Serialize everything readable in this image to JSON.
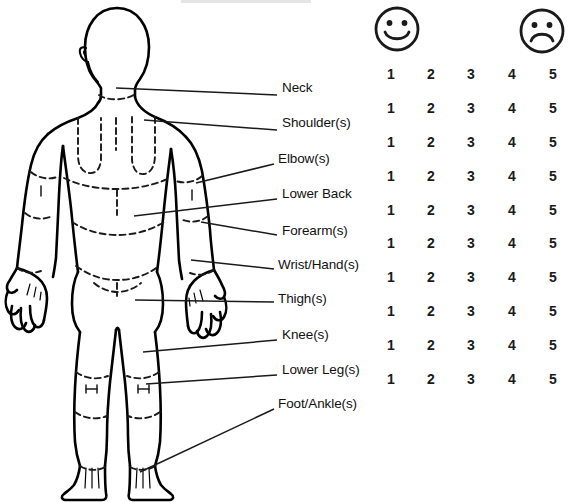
{
  "diagram": {
    "name": "body-map-rear-view"
  },
  "labels": [
    {
      "id": "neck",
      "text": "Neck",
      "x": 282,
      "y": 88,
      "lead": {
        "x1": 116,
        "y1": 88,
        "x2": 277,
        "y2": 95
      }
    },
    {
      "id": "shoulder",
      "text": "Shoulder(s)",
      "x": 282,
      "y": 123,
      "lead": {
        "x1": 144,
        "y1": 120,
        "x2": 277,
        "y2": 130
      }
    },
    {
      "id": "elbow",
      "text": "Elbow(s)",
      "x": 278,
      "y": 159,
      "lead": {
        "x1": 196,
        "y1": 183,
        "x2": 274,
        "y2": 164
      }
    },
    {
      "id": "lower-back",
      "text": "Lower Back",
      "x": 282,
      "y": 194,
      "lead": {
        "x1": 134,
        "y1": 216,
        "x2": 277,
        "y2": 199
      }
    },
    {
      "id": "forearm",
      "text": "Forearm(s)",
      "x": 282,
      "y": 231,
      "lead": {
        "x1": 201,
        "y1": 222,
        "x2": 277,
        "y2": 235
      }
    },
    {
      "id": "wrist-hand",
      "text": "Wrist/Hand(s)",
      "x": 278,
      "y": 265,
      "lead": {
        "x1": 191,
        "y1": 260,
        "x2": 274,
        "y2": 269
      }
    },
    {
      "id": "thigh",
      "text": "Thigh(s)",
      "x": 278,
      "y": 299,
      "lead": {
        "x1": 135,
        "y1": 300,
        "x2": 274,
        "y2": 302
      }
    },
    {
      "id": "knee",
      "text": "Knee(s)",
      "x": 282,
      "y": 335,
      "lead": {
        "x1": 143,
        "y1": 352,
        "x2": 277,
        "y2": 340
      }
    },
    {
      "id": "lower-leg",
      "text": "Lower Leg(s)",
      "x": 282,
      "y": 370,
      "lead": {
        "x1": 146,
        "y1": 384,
        "x2": 277,
        "y2": 375
      }
    },
    {
      "id": "foot-ankle",
      "text": "Foot/Ankle(s)",
      "x": 278,
      "y": 404,
      "lead": {
        "x1": 140,
        "y1": 472,
        "x2": 274,
        "y2": 409
      }
    }
  ],
  "scale": {
    "happy_icon": "smiley-happy-face",
    "sad_icon": "smiley-sad-face",
    "min_label": "1",
    "max_label": "5",
    "columns": [
      "1",
      "2",
      "3",
      "4",
      "5"
    ],
    "rows": [
      {
        "part": "Neck",
        "values": [
          "1",
          "2",
          "3",
          "4",
          "5"
        ]
      },
      {
        "part": "Shoulder(s)",
        "values": [
          "1",
          "2",
          "3",
          "4",
          "5"
        ]
      },
      {
        "part": "Elbow(s)",
        "values": [
          "1",
          "2",
          "3",
          "4",
          "5"
        ]
      },
      {
        "part": "Lower Back",
        "values": [
          "1",
          "2",
          "3",
          "4",
          "5"
        ]
      },
      {
        "part": "Forearm(s)",
        "values": [
          "1",
          "2",
          "3",
          "4",
          "5"
        ]
      },
      {
        "part": "Wrist/Hand(s)",
        "values": [
          "1",
          "2",
          "3",
          "4",
          "5"
        ]
      },
      {
        "part": "Thigh(s)",
        "values": [
          "1",
          "2",
          "3",
          "4",
          "5"
        ]
      },
      {
        "part": "Knee(s)",
        "values": [
          "1",
          "2",
          "3",
          "4",
          "5"
        ]
      },
      {
        "part": "Lower Leg(s)",
        "values": [
          "1",
          "2",
          "3",
          "4",
          "5"
        ]
      },
      {
        "part": "Foot/Ankle(s)",
        "values": [
          "1",
          "2",
          "3",
          "4",
          "5"
        ]
      }
    ]
  },
  "colors": {
    "ink": "#111111",
    "background": "#ffffff",
    "outline": "#000000"
  }
}
